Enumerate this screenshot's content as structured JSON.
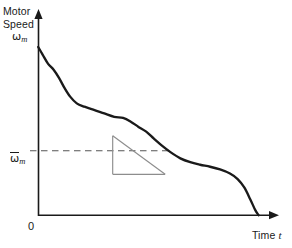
{
  "figure": {
    "name": "motor-speed-vs-time-plot",
    "background_color": "#ffffff",
    "ink_color": "#1a1a1a",
    "construction_color": "#8a8a8a"
  },
  "labels": {
    "y_title_line1": "Motor",
    "y_title_line2": "Speed",
    "y_peak_symbol": "ω",
    "y_peak_subscript": "m",
    "y_average_symbol": "ω",
    "y_average_subscript": "m",
    "y_average_has_overbar": true,
    "origin": "0",
    "x_title": "Time",
    "x_variable": "t"
  },
  "chart_data": {
    "type": "line",
    "xlabel": "Time t",
    "ylabel": "Motor Speed",
    "grid": false,
    "legend": null,
    "axes": {
      "x_ticks": [
        "0"
      ],
      "y_ticks": [
        "ω_m",
        "ω̄_m"
      ],
      "x_arrow": true,
      "y_arrow": true,
      "x_range_label": [
        "0",
        "Time t"
      ],
      "y_range_label": [
        "0",
        "ω_m"
      ]
    },
    "series": [
      {
        "name": "motor-speed-decay",
        "style": "solid-thick",
        "description": "Motor speed decays from peak at t=0, with a gently stepped/wavy slope, flattening in the mid-late region, then dropping steeply to zero at the end.",
        "points": [
          {
            "x": 0.0,
            "y": 1.0
          },
          {
            "x": 0.02,
            "y": 0.955
          },
          {
            "x": 0.045,
            "y": 0.9
          },
          {
            "x": 0.07,
            "y": 0.865
          },
          {
            "x": 0.095,
            "y": 0.815
          },
          {
            "x": 0.12,
            "y": 0.755
          },
          {
            "x": 0.145,
            "y": 0.705
          },
          {
            "x": 0.175,
            "y": 0.665
          },
          {
            "x": 0.21,
            "y": 0.645
          },
          {
            "x": 0.25,
            "y": 0.628
          },
          {
            "x": 0.3,
            "y": 0.605
          },
          {
            "x": 0.345,
            "y": 0.585
          },
          {
            "x": 0.385,
            "y": 0.578
          },
          {
            "x": 0.42,
            "y": 0.556
          },
          {
            "x": 0.455,
            "y": 0.525
          },
          {
            "x": 0.49,
            "y": 0.497
          },
          {
            "x": 0.525,
            "y": 0.455
          },
          {
            "x": 0.56,
            "y": 0.415
          },
          {
            "x": 0.6,
            "y": 0.375
          },
          {
            "x": 0.645,
            "y": 0.338
          },
          {
            "x": 0.69,
            "y": 0.315
          },
          {
            "x": 0.735,
            "y": 0.3
          },
          {
            "x": 0.78,
            "y": 0.288
          },
          {
            "x": 0.825,
            "y": 0.272
          },
          {
            "x": 0.87,
            "y": 0.248
          },
          {
            "x": 0.905,
            "y": 0.215
          },
          {
            "x": 0.935,
            "y": 0.165
          },
          {
            "x": 0.962,
            "y": 0.095
          },
          {
            "x": 0.985,
            "y": 0.03
          },
          {
            "x": 1.0,
            "y": 0.0
          }
        ]
      }
    ],
    "annotations": [
      {
        "name": "average-speed-dashed-line",
        "type": "horizontal-dashed-line",
        "y_value": 0.383,
        "label": "ω̄_m",
        "from_x": 0.0,
        "to_x": 0.575
      },
      {
        "name": "slope-triangle",
        "type": "right-triangle",
        "description": "Construction triangle showing the tangent slope of the decay curve around the average speed level.",
        "apex": {
          "x": 0.338,
          "y": 0.472
        },
        "bottom_left": {
          "x": 0.338,
          "y": 0.243
        },
        "bottom_right": {
          "x": 0.576,
          "y": 0.243
        }
      }
    ]
  }
}
